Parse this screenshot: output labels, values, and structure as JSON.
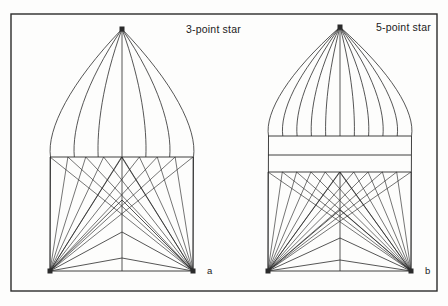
{
  "figure": {
    "name": "star-panel-construction-diagram",
    "background_color": "#fdfdfc",
    "line_color": "#2b2b2b",
    "border": {
      "x": 11,
      "y": 14,
      "width": 426,
      "height": 277,
      "stroke_width": 1.4
    }
  },
  "panels": [
    {
      "id": "panel-a",
      "title": "3-point star",
      "title_x": 186,
      "title_y": 33,
      "item_label": "a",
      "item_label_x": 207,
      "item_label_y": 274,
      "apex": {
        "x": 122,
        "y": 29
      },
      "left_corner": {
        "x": 50,
        "y": 271
      },
      "right_corner": {
        "x": 193,
        "y": 271
      },
      "center_x": 122,
      "waist_lines_y": [
        157
      ],
      "dome_rays": 7,
      "dome_half_span": 71,
      "fan_rays": 9,
      "chevron_apex_y": [
        157,
        200,
        232,
        258
      ],
      "marker_size": 5
    },
    {
      "id": "panel-b",
      "title": "5-point star",
      "title_x": 376,
      "title_y": 31,
      "item_label": "b",
      "item_label_x": 425,
      "item_label_y": 274,
      "apex": {
        "x": 340,
        "y": 27
      },
      "left_corner": {
        "x": 268,
        "y": 271
      },
      "right_corner": {
        "x": 411,
        "y": 271
      },
      "center_x": 340,
      "waist_lines_y": [
        136,
        155,
        172
      ],
      "dome_rays": 11,
      "dome_half_span": 71,
      "fan_rays": 11,
      "chevron_apex_y": [
        172,
        210,
        238,
        260
      ],
      "marker_size": 5
    }
  ],
  "chart_data": {
    "type": "diagram",
    "panels": [
      {
        "label": "3-point star",
        "key": "a",
        "dome_radiating_lines": 7,
        "waist_bands": 1,
        "fan_lines_per_corner": 9,
        "chevron_tiers": 4
      },
      {
        "label": "5-point star",
        "key": "b",
        "dome_radiating_lines": 11,
        "waist_bands": 2,
        "fan_lines_per_corner": 11,
        "chevron_tiers": 4
      }
    ]
  }
}
